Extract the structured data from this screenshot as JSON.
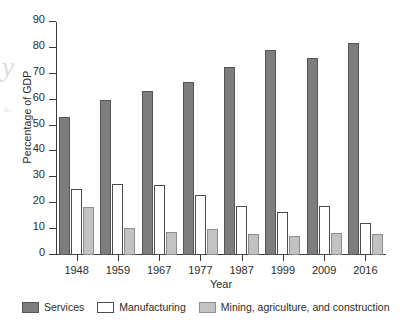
{
  "chart_data": {
    "type": "bar",
    "title": "",
    "xlabel": "Year",
    "ylabel": "Percentage of GDP",
    "categories": [
      "1948",
      "1959",
      "1967",
      "1977",
      "1987",
      "1999",
      "2009",
      "2016"
    ],
    "series": [
      {
        "name": "Services",
        "color": "#7d7d7d",
        "values": [
          53.5,
          60.0,
          63.5,
          67.0,
          72.5,
          79.0,
          76.0,
          82.0
        ]
      },
      {
        "name": "Manufacturing",
        "color": "#ffffff",
        "values": [
          25.5,
          27.5,
          27.0,
          23.0,
          19.0,
          16.5,
          19.0,
          12.5
        ]
      },
      {
        "name": "Mining, agriculture, and construction",
        "color": "#c2c2c2",
        "values": [
          18.5,
          10.5,
          9.0,
          10.0,
          8.0,
          7.5,
          8.5,
          8.0
        ]
      }
    ],
    "ylim": [
      0,
      90
    ],
    "yticks": [
      0,
      10,
      20,
      30,
      40,
      50,
      60,
      70,
      80,
      90
    ],
    "ytick_labels": [
      "0",
      "10",
      "20",
      "30",
      "40",
      "50",
      "60",
      "70",
      "80",
      "90"
    ],
    "grid": false,
    "legend_position": "bottom"
  },
  "artifacts": {
    "bleed_letter": "y",
    "bleed_mark": "s."
  }
}
